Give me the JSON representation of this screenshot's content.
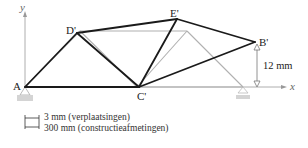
{
  "diagram": {
    "title": "",
    "axes": {
      "x_label": "x",
      "y_label": "y"
    },
    "nodes": {
      "A": "A",
      "B_prime": "B'",
      "C_prime": "C'",
      "D_prime": "D'",
      "E_prime": "E'"
    },
    "dimension": {
      "label": "12 mm"
    },
    "legend": [
      {
        "symbol": "scale-bar",
        "label": "3 mm (verplaatsingen)"
      },
      {
        "symbol": "scale-bar",
        "label": "300 mm (constructieafmetingen)"
      }
    ],
    "colors": {
      "deformed": "#1a1a1a",
      "original": "#b0b0b0",
      "support": "#cfcfcf",
      "axis": "#999999"
    }
  }
}
